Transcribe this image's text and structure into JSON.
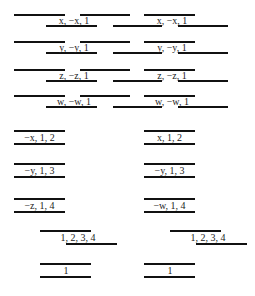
{
  "diagram": {
    "top_rows": [
      {
        "y": 14,
        "top_lines": [
          [
            14,
            65
          ],
          [
            80,
            130
          ],
          [
            144,
            195
          ]
        ],
        "bottom_lines": [
          [
            46,
            97
          ],
          [
            113,
            162
          ],
          [
            178,
            228
          ]
        ],
        "labels": [
          {
            "text": "x, −x, 1",
            "x": 74
          },
          {
            "text": "x, −x, 1",
            "x": 172
          }
        ]
      },
      {
        "y": 41,
        "top_lines": [
          [
            14,
            65
          ],
          [
            80,
            130
          ],
          [
            144,
            195
          ]
        ],
        "bottom_lines": [
          [
            46,
            97
          ],
          [
            113,
            162
          ],
          [
            178,
            228
          ]
        ],
        "labels": [
          {
            "text": "y, −y, 1",
            "x": 74
          },
          {
            "text": "y, −y, 1",
            "x": 172
          }
        ]
      },
      {
        "y": 69,
        "top_lines": [
          [
            14,
            65
          ],
          [
            80,
            130
          ],
          [
            144,
            195
          ]
        ],
        "bottom_lines": [
          [
            46,
            97
          ],
          [
            113,
            162
          ],
          [
            178,
            228
          ]
        ],
        "labels": [
          {
            "text": "z, −z, 1",
            "x": 74
          },
          {
            "text": "z, −z, 1",
            "x": 172
          }
        ]
      },
      {
        "y": 95,
        "top_lines": [
          [
            14,
            65
          ],
          [
            80,
            130
          ],
          [
            144,
            195
          ]
        ],
        "bottom_lines": [
          [
            46,
            97
          ],
          [
            113,
            162
          ],
          [
            178,
            228
          ]
        ],
        "labels": [
          {
            "text": "w, −w, 1",
            "x": 74
          },
          {
            "text": "w, −w, 1",
            "x": 172
          }
        ]
      }
    ],
    "middle_rows": [
      {
        "y": 130,
        "left": {
          "text": "−x, 1, 2",
          "x1": 14,
          "x2": 65
        },
        "right": {
          "text": "x, 1, 2",
          "x1": 144,
          "x2": 195
        }
      },
      {
        "y": 163,
        "left": {
          "text": "−y, 1, 3",
          "x1": 14,
          "x2": 65
        },
        "right": {
          "text": "−y, 1, 3",
          "x1": 144,
          "x2": 195
        }
      },
      {
        "y": 198,
        "left": {
          "text": "−z, 1, 4",
          "x1": 14,
          "x2": 65
        },
        "right": {
          "text": "−w, 1, 4",
          "x1": 144,
          "x2": 195
        }
      }
    ],
    "bottom_blocks": [
      {
        "y": 230,
        "top_line": [
          40,
          91
        ],
        "bottom_line": [
          66,
          117
        ],
        "label": "1, 2, 3, 4",
        "label_x": 78
      },
      {
        "y": 230,
        "top_line": [
          170,
          221
        ],
        "bottom_line": [
          196,
          247
        ],
        "label": "1, 2, 3, 4",
        "label_x": 208
      }
    ],
    "unit_blocks": [
      {
        "y": 263,
        "line": [
          40,
          91
        ],
        "label": "1",
        "tick_x": 66
      },
      {
        "y": 263,
        "line": [
          144,
          195
        ],
        "label": "1",
        "tick_x": 170
      }
    ]
  }
}
